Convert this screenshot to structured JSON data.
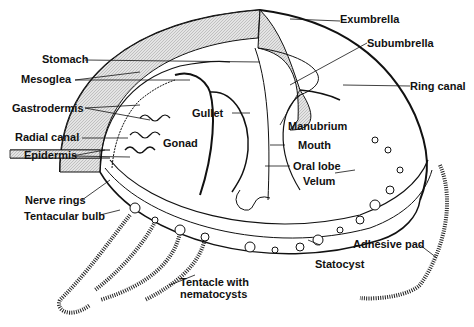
{
  "diagram": {
    "labels": {
      "exumbrella": "Exumbrella",
      "subumbrella": "Subumbrella",
      "stomach": "Stomach",
      "mesoglea": "Mesoglea",
      "gastrodermis": "Gastrodermis",
      "radial_canal": "Radial canal",
      "epidermis": "Epidermis",
      "gonad": "Gonad",
      "gullet": "Gullet",
      "ring_canal": "Ring canal",
      "manubrium": "Manubrium",
      "mouth": "Mouth",
      "oral_lobe": "Oral lobe",
      "velum": "Velum",
      "nerve_rings": "Nerve rings",
      "tentacular_bulb": "Tentacular bulb",
      "tentacle_line1": "Tentacle with",
      "tentacle_line2": "nematocysts",
      "statocyst": "Statocyst",
      "adhesive_pad": "Adhesive pad"
    },
    "colors": {
      "ink": "#111111",
      "shade": "#cfcfcf",
      "background": "#ffffff"
    }
  }
}
